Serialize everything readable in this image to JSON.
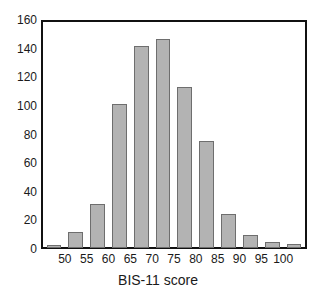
{
  "chart_data": {
    "type": "bar",
    "title": "",
    "xlabel": "BIS-11 score",
    "ylabel": "",
    "grid": false,
    "legend": "none",
    "ylim": [
      0,
      160
    ],
    "xlim": [
      45,
      105
    ],
    "bin_width": 5,
    "bin_starts": [
      45,
      50,
      55,
      60,
      65,
      70,
      75,
      80,
      85,
      90,
      95,
      100
    ],
    "categories": [
      "45-50",
      "50-55",
      "55-60",
      "60-65",
      "65-70",
      "70-75",
      "75-80",
      "80-85",
      "85-90",
      "90-95",
      "95-100",
      "100-105"
    ],
    "values": [
      2,
      11,
      31,
      102,
      143,
      148,
      114,
      76,
      24,
      9,
      4,
      3
    ],
    "y_ticks": [
      "0",
      "20",
      "40",
      "60",
      "80",
      "100",
      "120",
      "140",
      "160"
    ],
    "y_tick_values": [
      0,
      20,
      40,
      60,
      80,
      100,
      120,
      140,
      160
    ],
    "x_ticks": [
      "50",
      "55",
      "60",
      "65",
      "70",
      "75",
      "80",
      "85",
      "90",
      "95",
      "100"
    ],
    "x_tick_values": [
      50,
      55,
      60,
      65,
      70,
      75,
      80,
      85,
      90,
      95,
      100
    ],
    "colors": {
      "bar_fill": "#b3b3b3",
      "bar_border": "#6e6e6e",
      "axis": "#111111",
      "text": "#1a1a1a",
      "background": "#ffffff"
    }
  }
}
